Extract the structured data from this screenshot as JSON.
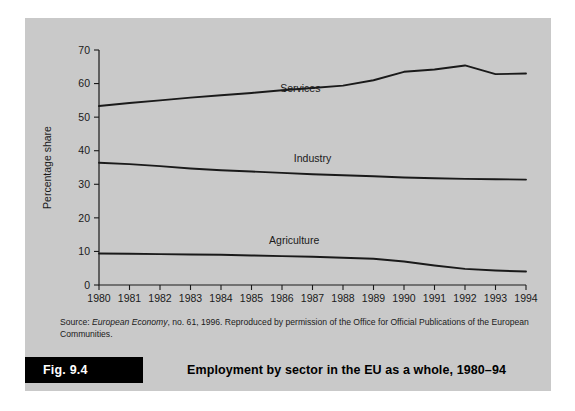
{
  "figure": {
    "tag": "Fig. 9.4",
    "title": "Employment by sector in the EU as a whole, 1980–94",
    "source_prefix": "Source: ",
    "source_italic": "European Economy",
    "source_rest": ", no. 61, 1996. Reproduced by permission of the Office for Official Publications of the European Communities.",
    "panel_color": "#c9c9c9",
    "ink_color": "#1a1a1a"
  },
  "chart_data": {
    "type": "line",
    "title": "Employment by sector in the EU as a whole, 1980–94",
    "xlabel": "",
    "ylabel": "Percentage share",
    "x": [
      1980,
      1981,
      1982,
      1983,
      1984,
      1985,
      1986,
      1987,
      1988,
      1989,
      1990,
      1991,
      1992,
      1993,
      1994
    ],
    "xtick_labels": [
      "1980",
      "1981",
      "1982",
      "1983",
      "1984",
      "1985",
      "1986",
      "1987",
      "1988",
      "1989",
      "1990",
      "1991",
      "1992",
      "1993",
      "1994"
    ],
    "ytick_labels": [
      "0",
      "10",
      "20",
      "30",
      "40",
      "50",
      "60",
      "70"
    ],
    "yticks": [
      0,
      10,
      20,
      30,
      40,
      50,
      60,
      70
    ],
    "ylim": [
      0,
      70
    ],
    "xlim": [
      1980,
      1994
    ],
    "grid": false,
    "legend": "inline-labels",
    "series": [
      {
        "name": "Services",
        "label_x": 1986.6,
        "label_y": 57.5,
        "values": [
          53.3,
          54.2,
          55.0,
          55.8,
          56.5,
          57.2,
          58.0,
          58.7,
          59.4,
          61.0,
          63.5,
          64.2,
          65.4,
          62.8,
          63.0
        ]
      },
      {
        "name": "Industry",
        "label_x": 1987.0,
        "label_y": 36.5,
        "values": [
          36.4,
          36.0,
          35.4,
          34.7,
          34.2,
          33.8,
          33.4,
          33.0,
          32.7,
          32.4,
          32.0,
          31.8,
          31.6,
          31.5,
          31.4
        ]
      },
      {
        "name": "Agriculture",
        "label_x": 1986.4,
        "label_y": 12.2,
        "values": [
          9.4,
          9.3,
          9.2,
          9.1,
          9.0,
          8.8,
          8.6,
          8.4,
          8.1,
          7.8,
          7.0,
          5.8,
          4.8,
          4.3,
          4.0
        ]
      }
    ]
  }
}
